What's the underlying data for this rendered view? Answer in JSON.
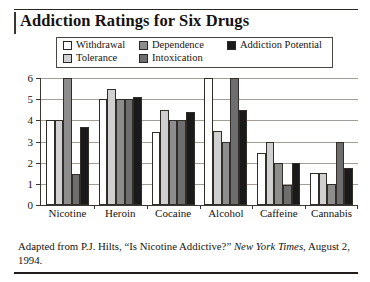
{
  "figure": {
    "title": "Addiction Ratings for Six Drugs",
    "caption_part1": "Adapted from P.J. Hilts, “Is Nicotine Addictive?” ",
    "caption_source": "New York Times",
    "caption_part2": ", August 2, 1994."
  },
  "legend": {
    "items": [
      {
        "label": "Withdrawal",
        "color": "#ffffff",
        "swatch_name": "legend-swatch-withdrawal"
      },
      {
        "label": "Dependence",
        "color": "#8d8d8d",
        "swatch_name": "legend-swatch-dependence"
      },
      {
        "label": "Addiction Potential",
        "color": "#1a1a1a",
        "swatch_name": "legend-swatch-addiction-potential"
      },
      {
        "label": "Tolerance",
        "color": "#d0d0d0",
        "swatch_name": "legend-swatch-tolerance"
      },
      {
        "label": "Intoxication",
        "color": "#6e6e6e",
        "swatch_name": "legend-swatch-intoxication"
      }
    ]
  },
  "chart_data": {
    "type": "bar",
    "title": "Addiction Ratings for Six Drugs",
    "xlabel": "",
    "ylabel": "",
    "ylim": [
      0,
      6
    ],
    "yticks": [
      0,
      1,
      2,
      3,
      4,
      5,
      6
    ],
    "grid": true,
    "legend_position": "top",
    "categories": [
      "Nicotine",
      "Heroin",
      "Cocaine",
      "Alcohol",
      "Caffeine",
      "Cannabis"
    ],
    "series": [
      {
        "name": "Withdrawal",
        "color": "#ffffff",
        "values": [
          4.0,
          5.0,
          3.45,
          6.0,
          2.45,
          1.5
        ]
      },
      {
        "name": "Tolerance",
        "color": "#d0d0d0",
        "values": [
          4.0,
          5.5,
          4.5,
          3.5,
          3.0,
          1.5
        ]
      },
      {
        "name": "Dependence",
        "color": "#8d8d8d",
        "values": [
          6.0,
          5.0,
          4.0,
          3.0,
          2.0,
          1.0
        ]
      },
      {
        "name": "Intoxication",
        "color": "#6e6e6e",
        "values": [
          1.45,
          5.0,
          4.0,
          6.0,
          0.95,
          3.0
        ]
      },
      {
        "name": "Addiction Potential",
        "color": "#1a1a1a",
        "values": [
          3.7,
          5.1,
          4.4,
          4.5,
          2.0,
          1.75
        ]
      }
    ]
  }
}
